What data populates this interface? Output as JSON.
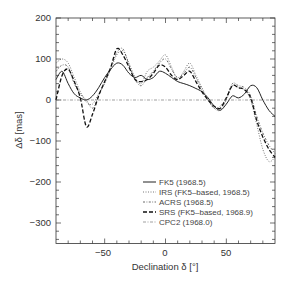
{
  "chart_data": {
    "type": "line",
    "title": "",
    "xlabel": "Declination δ [°]",
    "ylabel": "Δδ [mas]",
    "xlim": [
      -90,
      90
    ],
    "ylim": [
      -350,
      200
    ],
    "xticks": [
      -50,
      0,
      50
    ],
    "yticks": [
      200,
      100,
      0,
      -100,
      -200,
      -300
    ],
    "grid": false,
    "legend_position": "lower right (inside)",
    "series": [
      {
        "name": "FK5 (1968.5)",
        "style": "solid",
        "x": [
          -90,
          -85,
          -80,
          -75,
          -70,
          -65,
          -60,
          -55,
          -50,
          -45,
          -40,
          -35,
          -30,
          -25,
          -20,
          -15,
          -10,
          -5,
          0,
          5,
          10,
          15,
          20,
          25,
          30,
          35,
          40,
          45,
          50,
          55,
          60,
          65,
          70,
          75,
          80,
          85,
          90
        ],
        "values": [
          50,
          70,
          40,
          15,
          5,
          0,
          10,
          30,
          55,
          75,
          90,
          85,
          65,
          55,
          60,
          50,
          55,
          70,
          65,
          55,
          45,
          40,
          35,
          28,
          20,
          5,
          -15,
          -25,
          -10,
          10,
          5,
          15,
          35,
          30,
          0,
          -25,
          -40
        ]
      },
      {
        "name": "IRS (FK5-based, 1968.5)",
        "style": "dotted",
        "x": [
          -90,
          -85,
          -80,
          -75,
          -70,
          -65,
          -60,
          -55,
          -50,
          -45,
          -40,
          -35,
          -30,
          -25,
          -20,
          -15,
          -10,
          -5,
          0,
          5,
          10,
          15,
          20,
          25,
          30,
          35,
          40,
          45,
          50,
          55,
          60,
          65,
          70,
          75,
          80,
          85,
          90
        ],
        "values": [
          90,
          100,
          90,
          55,
          20,
          -5,
          -10,
          15,
          40,
          75,
          110,
          120,
          90,
          55,
          40,
          70,
          80,
          95,
          110,
          80,
          50,
          70,
          90,
          60,
          30,
          0,
          -20,
          -25,
          0,
          35,
          30,
          25,
          0,
          -60,
          -120,
          -150,
          -140
        ]
      },
      {
        "name": "ACRS (1968.5)",
        "style": "dash-dot-fine",
        "x": [
          -90,
          -85,
          -80,
          -75,
          -70,
          -65,
          -60,
          -55,
          -50,
          -45,
          -40,
          -35,
          -30,
          -25,
          -20,
          -15,
          -10,
          -5,
          0,
          5,
          10,
          15,
          20,
          25,
          30,
          35,
          40,
          45,
          50,
          55,
          60,
          65,
          70,
          75,
          80,
          85,
          90
        ],
        "values": [
          70,
          85,
          80,
          40,
          15,
          0,
          -20,
          10,
          45,
          80,
          115,
          125,
          85,
          50,
          35,
          55,
          70,
          90,
          100,
          75,
          55,
          65,
          80,
          55,
          25,
          0,
          -20,
          -15,
          5,
          40,
          35,
          30,
          10,
          -40,
          -80,
          -110,
          -130
        ]
      },
      {
        "name": "SRS (FK5-based, 1968.9)",
        "style": "dashed-heavy",
        "x": [
          -90,
          -85,
          -80,
          -75,
          -70,
          -65,
          -60,
          -55,
          -50,
          -45,
          -40,
          -35,
          -30,
          -25,
          -20,
          -15,
          -10,
          -5,
          0,
          5,
          10,
          15,
          20,
          25,
          30,
          35,
          40,
          45,
          50,
          55,
          60,
          65,
          70,
          75,
          80,
          85,
          90
        ],
        "values": [
          0,
          60,
          75,
          45,
          5,
          -65,
          -35,
          10,
          45,
          80,
          125,
          110,
          80,
          50,
          45,
          50,
          65,
          85,
          80,
          60,
          50,
          60,
          70,
          45,
          20,
          0,
          -15,
          -20,
          5,
          35,
          30,
          25,
          5,
          -50,
          -90,
          -120,
          -140
        ]
      },
      {
        "name": "CPC2 (1968.0)",
        "style": "dash-dot",
        "x": [
          -90,
          -80,
          -70,
          -60,
          -50,
          -40,
          -30,
          -20,
          -10,
          0,
          10,
          20,
          30,
          40,
          50,
          60,
          70,
          80,
          90
        ],
        "values": [
          0,
          0,
          0,
          0,
          0,
          0,
          0,
          0,
          0,
          0,
          0,
          0,
          0,
          0,
          0,
          0,
          0,
          0,
          0
        ]
      }
    ]
  },
  "axes": {
    "x_tick_labels": [
      "−50",
      "0",
      "50"
    ],
    "y_tick_labels": [
      "200",
      "100",
      "0",
      "−100",
      "−200",
      "−300"
    ],
    "x_title": "Declination δ [°]",
    "y_title": "Δδ [mas]"
  },
  "legend": {
    "entries": [
      {
        "label": "FK5 (1968.5)",
        "style": "solid"
      },
      {
        "label": "IRS (FK5–based, 1968.5)",
        "style": "dotted"
      },
      {
        "label": "ACRS (1968.5)",
        "style": "dash-dot-fine"
      },
      {
        "label": "SRS (FK5–based, 1968.9)",
        "style": "dashed-heavy"
      },
      {
        "label": "CPC2 (1968.0)",
        "style": "dash-dot"
      }
    ]
  }
}
